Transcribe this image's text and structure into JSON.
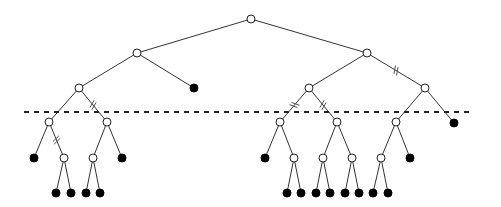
{
  "diagram": {
    "type": "binary-tree",
    "node_radius": 4,
    "colors": {
      "edge": "#333333",
      "open_node_fill": "#ffffff",
      "filled_node": "#000000",
      "cut_line": "#222222"
    },
    "cut_line": {
      "x1": 24,
      "x2": 474,
      "y": 112
    },
    "nodes": [
      {
        "id": "root",
        "x": 251,
        "y": 19,
        "kind": "open"
      },
      {
        "id": "a",
        "x": 137,
        "y": 53,
        "kind": "open"
      },
      {
        "id": "b",
        "x": 367,
        "y": 53,
        "kind": "open"
      },
      {
        "id": "a1",
        "x": 79,
        "y": 88,
        "kind": "open"
      },
      {
        "id": "a2",
        "x": 194,
        "y": 88,
        "kind": "filled"
      },
      {
        "id": "b1",
        "x": 309,
        "y": 88,
        "kind": "open"
      },
      {
        "id": "b2",
        "x": 425,
        "y": 88,
        "kind": "open"
      },
      {
        "id": "a11",
        "x": 49,
        "y": 122,
        "kind": "open"
      },
      {
        "id": "a12",
        "x": 107,
        "y": 122,
        "kind": "open"
      },
      {
        "id": "b11",
        "x": 280,
        "y": 122,
        "kind": "open"
      },
      {
        "id": "b12",
        "x": 337,
        "y": 122,
        "kind": "open"
      },
      {
        "id": "b21",
        "x": 396,
        "y": 122,
        "kind": "open"
      },
      {
        "id": "b22",
        "x": 454,
        "y": 123,
        "kind": "filled"
      },
      {
        "id": "a111",
        "x": 34,
        "y": 158,
        "kind": "filled"
      },
      {
        "id": "a112",
        "x": 64,
        "y": 158,
        "kind": "open"
      },
      {
        "id": "a121",
        "x": 93,
        "y": 158,
        "kind": "open"
      },
      {
        "id": "a122",
        "x": 122,
        "y": 158,
        "kind": "filled"
      },
      {
        "id": "b111",
        "x": 265,
        "y": 158,
        "kind": "filled"
      },
      {
        "id": "b112",
        "x": 294,
        "y": 158,
        "kind": "open"
      },
      {
        "id": "b121",
        "x": 323,
        "y": 158,
        "kind": "open"
      },
      {
        "id": "b122",
        "x": 352,
        "y": 158,
        "kind": "open"
      },
      {
        "id": "b211",
        "x": 381,
        "y": 158,
        "kind": "open"
      },
      {
        "id": "b212",
        "x": 410,
        "y": 158,
        "kind": "filled"
      },
      {
        "id": "l1",
        "x": 56,
        "y": 193,
        "kind": "filled"
      },
      {
        "id": "l2",
        "x": 71,
        "y": 193,
        "kind": "filled"
      },
      {
        "id": "l3",
        "x": 86,
        "y": 193,
        "kind": "filled"
      },
      {
        "id": "l4",
        "x": 100,
        "y": 193,
        "kind": "filled"
      },
      {
        "id": "l5",
        "x": 287,
        "y": 193,
        "kind": "filled"
      },
      {
        "id": "l6",
        "x": 301,
        "y": 193,
        "kind": "filled"
      },
      {
        "id": "l7",
        "x": 316,
        "y": 193,
        "kind": "filled"
      },
      {
        "id": "l8",
        "x": 330,
        "y": 193,
        "kind": "filled"
      },
      {
        "id": "l9",
        "x": 345,
        "y": 193,
        "kind": "filled"
      },
      {
        "id": "l10",
        "x": 359,
        "y": 193,
        "kind": "filled"
      },
      {
        "id": "l11",
        "x": 373,
        "y": 193,
        "kind": "filled"
      },
      {
        "id": "l12",
        "x": 388,
        "y": 193,
        "kind": "filled"
      }
    ],
    "edges": [
      [
        "root",
        "a"
      ],
      [
        "root",
        "b"
      ],
      [
        "a",
        "a1"
      ],
      [
        "a",
        "a2"
      ],
      [
        "b",
        "b1"
      ],
      [
        "b",
        "b2",
        true
      ],
      [
        "a1",
        "a11"
      ],
      [
        "a1",
        "a12",
        true
      ],
      [
        "b1",
        "b11",
        true
      ],
      [
        "b1",
        "b12",
        true
      ],
      [
        "b2",
        "b21"
      ],
      [
        "b2",
        "b22"
      ],
      [
        "a11",
        "a111"
      ],
      [
        "a11",
        "a112",
        true
      ],
      [
        "a12",
        "a121"
      ],
      [
        "a12",
        "a122"
      ],
      [
        "b11",
        "b111"
      ],
      [
        "b11",
        "b112"
      ],
      [
        "b12",
        "b121"
      ],
      [
        "b12",
        "b122"
      ],
      [
        "b21",
        "b211"
      ],
      [
        "b21",
        "b212"
      ],
      [
        "a112",
        "l1"
      ],
      [
        "a112",
        "l2"
      ],
      [
        "a121",
        "l3"
      ],
      [
        "a121",
        "l4"
      ],
      [
        "b112",
        "l5"
      ],
      [
        "b112",
        "l6"
      ],
      [
        "b121",
        "l7"
      ],
      [
        "b121",
        "l8"
      ],
      [
        "b122",
        "l9"
      ],
      [
        "b122",
        "l10"
      ],
      [
        "b211",
        "l11"
      ],
      [
        "b211",
        "l12"
      ]
    ]
  }
}
